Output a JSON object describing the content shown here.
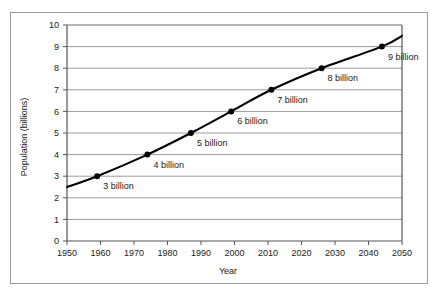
{
  "chart_data": {
    "type": "line",
    "title": "",
    "xlabel": "Year",
    "ylabel": "Population (billions)",
    "xlim": [
      1950,
      2050
    ],
    "ylim": [
      0,
      10
    ],
    "grid": true,
    "legend": "none",
    "xticks": [
      "1950",
      "1960",
      "1970",
      "1980",
      "1990",
      "2000",
      "2010",
      "2020",
      "2030",
      "2040",
      "2050"
    ],
    "yticks": [
      "0",
      "1",
      "2",
      "3",
      "4",
      "5",
      "6",
      "7",
      "8",
      "9",
      "10"
    ],
    "x": [
      1950,
      1959,
      1974,
      1987,
      1999,
      2011,
      2026,
      2044,
      2050
    ],
    "y": [
      2.5,
      3,
      4,
      5,
      6,
      7,
      8,
      9,
      9.5
    ],
    "markers": [
      {
        "x": 1959,
        "y": 3,
        "label": "3 billion"
      },
      {
        "x": 1974,
        "y": 4,
        "label": "4 billion"
      },
      {
        "x": 1987,
        "y": 5,
        "label": "5 billion"
      },
      {
        "x": 1999,
        "y": 6,
        "label": "6 billion"
      },
      {
        "x": 2011,
        "y": 7,
        "label": "7 billion"
      },
      {
        "x": 2026,
        "y": 8,
        "label": "8 billion"
      },
      {
        "x": 2044,
        "y": 9,
        "label": "9 billion"
      }
    ],
    "series": [
      {
        "name": "World population",
        "values": [
          2.5,
          3,
          4,
          5,
          6,
          7,
          8,
          9,
          9.5
        ]
      }
    ],
    "colors": {
      "line": "#000000",
      "marker": "#000000",
      "grid": "#9a9a9a",
      "axis": "#555555",
      "text": "#1a1a1a",
      "background": "#ffffff",
      "frame": "#9a9a9a"
    }
  }
}
